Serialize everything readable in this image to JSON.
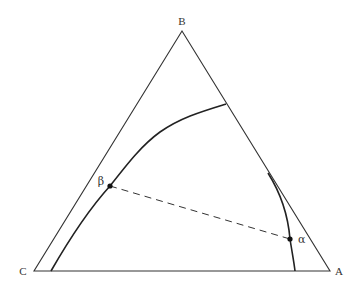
{
  "diagram": {
    "type": "ternary-phase-diagram",
    "vertices": {
      "top": "B",
      "left": "C",
      "right": "A"
    },
    "points": [
      {
        "id": "beta",
        "label": "β"
      },
      {
        "id": "alpha",
        "label": "α"
      }
    ],
    "tie_line": {
      "from": "β",
      "to": "α",
      "style": "dashed"
    },
    "colors": {
      "triangle": "#333333",
      "curve": "#222222",
      "tie_line": "#333333",
      "point": "#111111",
      "text": "#333333"
    }
  }
}
